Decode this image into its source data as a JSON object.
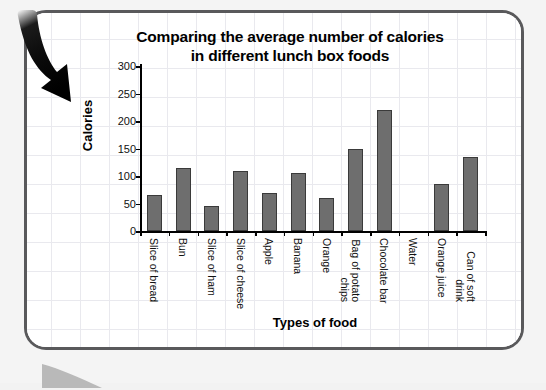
{
  "chart_data": {
    "type": "bar",
    "title": "Comparing the average number of calories in different lunch box foods",
    "title_line1": "Comparing the average number of calories",
    "title_line2": "in different lunch box foods",
    "xlabel": "Types of food",
    "ylabel": "Calories",
    "ylim": [
      0,
      300
    ],
    "yticks": [
      0,
      50,
      100,
      150,
      200,
      250,
      300
    ],
    "ytick_labels": [
      "0",
      "50",
      "100",
      "150",
      "200",
      "250",
      "300"
    ],
    "grid": true,
    "legend": "none",
    "bar_color": "#6e6e6e",
    "bar_edge_color": "#3a3a3a",
    "categories": [
      "Slice of bread",
      "Bun",
      "Slice of ham",
      "Slice of cheese",
      "Apple",
      "Banana",
      "Orange",
      "Bag of potato chips",
      "Chocolate bar",
      "Water",
      "Orange juice",
      "Can of soft drink"
    ],
    "values": [
      65,
      115,
      45,
      110,
      70,
      105,
      60,
      150,
      220,
      0,
      85,
      134
    ]
  },
  "decor": {
    "arrow_icon": "curved-down-right-arrow",
    "arrow_color": "#111111",
    "panel_border_color": "#59595b",
    "grid_color": "#e9e9ee"
  }
}
